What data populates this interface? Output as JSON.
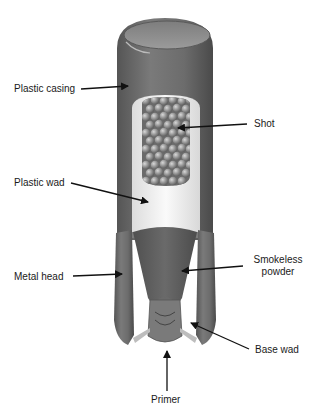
{
  "diagram": {
    "labels": {
      "plastic_casing": "Plastic casing",
      "shot": "Shot",
      "plastic_wad": "Plastic wad",
      "smokeless_powder_line1": "Smokeless",
      "smokeless_powder_line2": "powder",
      "metal_head": "Metal head",
      "base_wad": "Base wad",
      "primer": "Primer"
    },
    "colors": {
      "casing": "#6e6e6e",
      "casing_dark": "#4f4f4f",
      "top": "#8a8a8a",
      "wad": "#f0f0f0",
      "shot": "#9a9a9a",
      "powder": "#5e5e5e",
      "arrow": "#111111",
      "text": "#1a1a1a"
    }
  }
}
